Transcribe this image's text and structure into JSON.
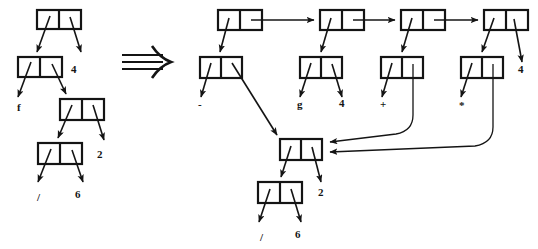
{
  "figure": {
    "transform_symbol": "double-right-arrow",
    "colors": {
      "ink": "#141414",
      "paper": "#ffffff"
    }
  },
  "left_structure": {
    "name": "original-cons-tree",
    "cells": [
      {
        "id": "L1",
        "x": 37,
        "y": 10,
        "w": 44,
        "h": 19
      },
      {
        "id": "L2",
        "x": 18,
        "y": 57,
        "w": 44,
        "h": 20
      },
      {
        "id": "L3",
        "x": 60,
        "y": 99,
        "w": 44,
        "h": 21
      },
      {
        "id": "L4",
        "x": 38,
        "y": 143,
        "w": 44,
        "h": 21
      }
    ],
    "atoms": [
      {
        "id": "L-atom-4",
        "label": "4",
        "x": 71,
        "y": 73
      },
      {
        "id": "L-atom-f",
        "label": "f",
        "x": 17,
        "y": 111
      },
      {
        "id": "L-atom-2",
        "label": "2",
        "x": 97,
        "y": 158
      },
      {
        "id": "L-atom-slash",
        "label": "/",
        "x": 37,
        "y": 201
      },
      {
        "id": "L-atom-6",
        "label": "6",
        "x": 75,
        "y": 198
      }
    ]
  },
  "right_structure": {
    "name": "transformed-cons-graph",
    "spine_cells": [
      {
        "id": "R-spine-1",
        "x": 218,
        "y": 10,
        "w": 44,
        "h": 20
      },
      {
        "id": "R-spine-2",
        "x": 320,
        "y": 10,
        "w": 44,
        "h": 20
      },
      {
        "id": "R-spine-3",
        "x": 401,
        "y": 10,
        "w": 44,
        "h": 20
      },
      {
        "id": "R-spine-4",
        "x": 484,
        "y": 10,
        "w": 44,
        "h": 20
      }
    ],
    "branch_cells": [
      {
        "id": "R-branch-1",
        "x": 200,
        "y": 57,
        "w": 42,
        "h": 21
      },
      {
        "id": "R-branch-2",
        "x": 300,
        "y": 57,
        "w": 42,
        "h": 21
      },
      {
        "id": "R-branch-3",
        "x": 381,
        "y": 57,
        "w": 42,
        "h": 21
      },
      {
        "id": "R-branch-4",
        "x": 461,
        "y": 57,
        "w": 42,
        "h": 21
      }
    ],
    "shared_cells": [
      {
        "id": "R-shared-1",
        "x": 280,
        "y": 139,
        "w": 42,
        "h": 21
      },
      {
        "id": "R-shared-2",
        "x": 258,
        "y": 182,
        "w": 44,
        "h": 21
      }
    ],
    "atoms": [
      {
        "id": "R-atom-minus",
        "label": "-",
        "x": 198,
        "y": 108
      },
      {
        "id": "R-atom-g",
        "label": "g",
        "x": 297,
        "y": 108
      },
      {
        "id": "R-atom-4a",
        "label": "4",
        "x": 339,
        "y": 107
      },
      {
        "id": "R-atom-plus",
        "label": "+",
        "x": 380,
        "y": 108
      },
      {
        "id": "R-atom-star",
        "label": "*",
        "x": 459,
        "y": 109
      },
      {
        "id": "R-atom-4b",
        "label": "4",
        "x": 518,
        "y": 73
      },
      {
        "id": "R-atom-2",
        "label": "2",
        "x": 318,
        "y": 196
      },
      {
        "id": "R-atom-slash",
        "label": "/",
        "x": 260,
        "y": 241
      },
      {
        "id": "R-atom-6",
        "label": "6",
        "x": 295,
        "y": 238
      }
    ]
  }
}
